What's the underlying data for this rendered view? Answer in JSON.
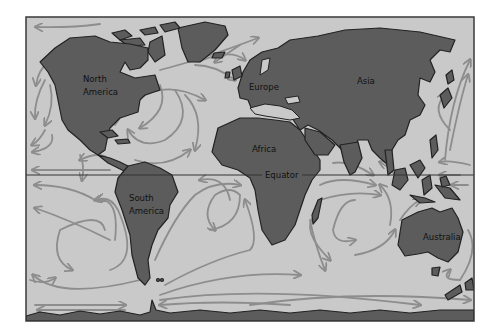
{
  "map": {
    "title": "World Ocean Currents",
    "colors": {
      "ocean": "#c9c9c9",
      "land": "#5c5c5c",
      "currents": "#8d8d8d",
      "outline": "#222222"
    },
    "labels": {
      "north_america_1": "North",
      "north_america_2": "America",
      "south_america_1": "South",
      "south_america_2": "America",
      "europe": "Europe",
      "asia": "Asia",
      "africa": "Africa",
      "australia": "Australia",
      "equator": "Equator"
    },
    "continents": [
      "North America",
      "South America",
      "Europe",
      "Asia",
      "Africa",
      "Australia",
      "Antarctica",
      "Greenland"
    ],
    "features": [
      "Equator line",
      "Ocean current arrows"
    ]
  }
}
